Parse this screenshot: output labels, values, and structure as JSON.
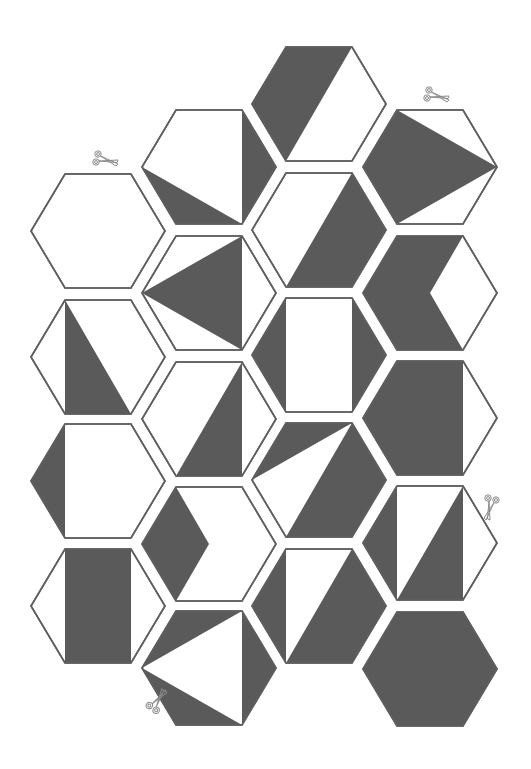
{
  "page": {
    "background": "#ffffff",
    "dark_color": "#5a5a5a",
    "outline_color": "#5f5f5f"
  },
  "hexagons": [
    {
      "id": "c0r0",
      "col": 0,
      "row": 0,
      "x": 31,
      "y": 174,
      "pattern": "blank",
      "dark": []
    },
    {
      "id": "c0r1",
      "col": 0,
      "row": 1,
      "x": 31,
      "y": 300,
      "pattern": "triangle-left-diagonal",
      "dark": [
        [
          "TL",
          "BR",
          "BL"
        ]
      ]
    },
    {
      "id": "c0r2",
      "col": 0,
      "row": 2,
      "x": 31,
      "y": 424,
      "pattern": "left-wedge",
      "dark": [
        [
          "L",
          "TL",
          "BL"
        ]
      ]
    },
    {
      "id": "c0r3",
      "col": 0,
      "row": 3,
      "x": 31,
      "y": 549,
      "pattern": "center-rectangle",
      "dark": [
        [
          "TL",
          "TR",
          "BR",
          "BL"
        ]
      ]
    },
    {
      "id": "c1r0",
      "col": 1,
      "row": 0,
      "x": 142,
      "y": 110,
      "pattern": "right-wedge-and-lower-triangle",
      "dark": [
        [
          "TR",
          "R",
          "BR"
        ],
        [
          "L",
          "BL",
          "BR"
        ]
      ]
    },
    {
      "id": "c1r1",
      "col": 1,
      "row": 1,
      "x": 142,
      "y": 236,
      "pattern": "arrow-triangle",
      "dark": [
        [
          "L",
          "TR",
          "BR"
        ]
      ]
    },
    {
      "id": "c1r2",
      "col": 1,
      "row": 2,
      "x": 142,
      "y": 362,
      "pattern": "lower-right-triangle",
      "dark": [
        [
          "TR",
          "BR",
          "BL"
        ]
      ]
    },
    {
      "id": "c1r3",
      "col": 1,
      "row": 3,
      "x": 142,
      "y": 487,
      "pattern": "left-rhombus",
      "dark": [
        [
          "L",
          "TL",
          "MID",
          "BL"
        ]
      ]
    },
    {
      "id": "c1r4",
      "col": 1,
      "row": 4,
      "x": 142,
      "y": 611,
      "pattern": "three-triangles",
      "dark": [
        [
          "TL",
          "TR",
          "L"
        ],
        [
          "L",
          "BR",
          "BL"
        ],
        [
          "TR",
          "R",
          "BR"
        ]
      ]
    },
    {
      "id": "c2r0",
      "col": 2,
      "row": 0,
      "x": 252,
      "y": 47,
      "pattern": "left-parallelogram",
      "dark": [
        [
          "L",
          "TL",
          "TR",
          "BL"
        ]
      ]
    },
    {
      "id": "c2r1",
      "col": 2,
      "row": 1,
      "x": 252,
      "y": 173,
      "pattern": "right-parallelogram",
      "dark": [
        [
          "TR",
          "R",
          "BR",
          "BL"
        ]
      ]
    },
    {
      "id": "c2r2",
      "col": 2,
      "row": 2,
      "x": 252,
      "y": 298,
      "pattern": "side-wedges",
      "dark": [
        [
          "L",
          "TL",
          "BL"
        ],
        [
          "TR",
          "R",
          "BR"
        ]
      ]
    },
    {
      "id": "c2r3",
      "col": 2,
      "row": 3,
      "x": 252,
      "y": 423,
      "pattern": "white-sliver",
      "dark": [
        [
          "TL",
          "TR",
          "L"
        ],
        [
          "TR",
          "R",
          "BR",
          "BL"
        ]
      ]
    },
    {
      "id": "c2r4",
      "col": 2,
      "row": 4,
      "x": 252,
      "y": 549,
      "pattern": "left-wedge-and-right-parallelogram",
      "dark": [
        [
          "L",
          "TL",
          "BL"
        ],
        [
          "TR",
          "R",
          "BR",
          "BL"
        ]
      ]
    },
    {
      "id": "c3r0",
      "col": 3,
      "row": 0,
      "x": 363,
      "y": 110,
      "pattern": "kite-arrow",
      "dark": [
        [
          "L",
          "TL",
          "R",
          "BL"
        ]
      ]
    },
    {
      "id": "c3r1",
      "col": 3,
      "row": 1,
      "x": 363,
      "y": 236,
      "pattern": "chevron",
      "dark": [
        [
          "L",
          "TL",
          "TR",
          "MID",
          "BR",
          "BL"
        ]
      ]
    },
    {
      "id": "c3r2",
      "col": 3,
      "row": 2,
      "x": 363,
      "y": 361,
      "pattern": "dark-except-right-wedge",
      "dark": [
        [
          "L",
          "TL",
          "TR",
          "BR",
          "BL"
        ]
      ]
    },
    {
      "id": "c3r3",
      "col": 3,
      "row": 3,
      "x": 363,
      "y": 486,
      "pattern": "left-wedge-and-lower-triangle",
      "dark": [
        [
          "L",
          "TL",
          "BL"
        ],
        [
          "TR",
          "BR",
          "BL"
        ]
      ]
    },
    {
      "id": "c3r4",
      "col": 3,
      "row": 4,
      "x": 363,
      "y": 612,
      "pattern": "solid",
      "dark": [
        [
          "L",
          "TL",
          "TR",
          "R",
          "BR",
          "BL"
        ]
      ]
    }
  ],
  "scissors": [
    {
      "id": "scissors-1",
      "x": 92,
      "y": 150,
      "rotate": 0
    },
    {
      "id": "scissors-2",
      "x": 423,
      "y": 86,
      "rotate": 0
    },
    {
      "id": "scissors-3",
      "x": 478,
      "y": 496,
      "rotate": 90
    },
    {
      "id": "scissors-4",
      "x": 145,
      "y": 692,
      "rotate": -70
    }
  ]
}
